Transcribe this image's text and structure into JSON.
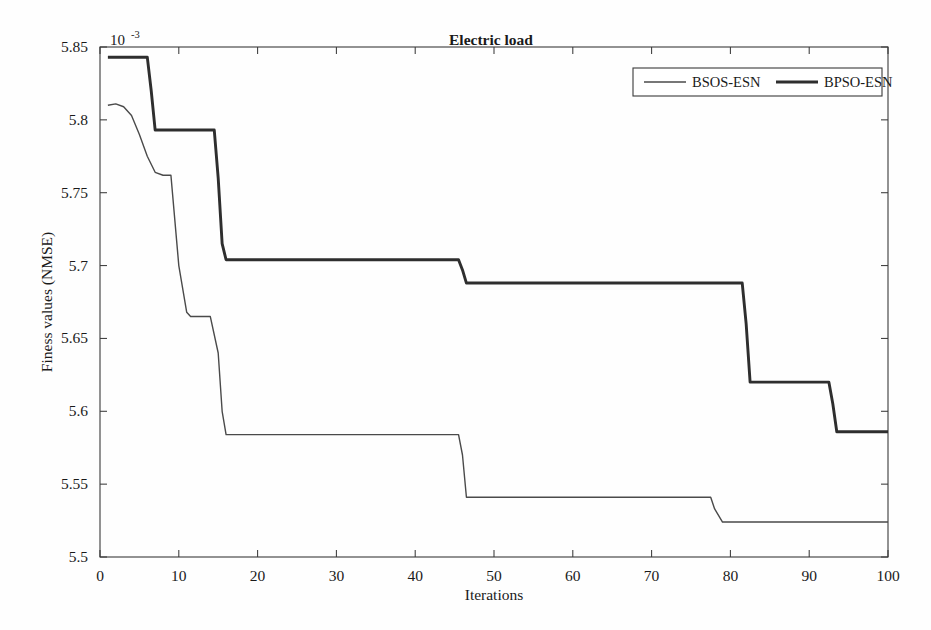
{
  "chart_data": {
    "type": "line",
    "title": "Electric load",
    "subtitle": "",
    "xlabel": "Iterations",
    "ylabel": "Finess values (NMSE)",
    "y_exponent_label": "10",
    "y_exponent_power": "-3",
    "xlim": [
      0,
      100
    ],
    "ylim": [
      5.5,
      5.85
    ],
    "xticks": [
      0,
      10,
      20,
      30,
      40,
      50,
      60,
      70,
      80,
      90,
      100
    ],
    "xticklabels": [
      "0",
      "10",
      "20",
      "30",
      "40",
      "50",
      "60",
      "70",
      "80",
      "90",
      "100"
    ],
    "yticks": [
      5.5,
      5.55,
      5.6,
      5.65,
      5.7,
      5.75,
      5.8,
      5.85
    ],
    "yticklabels": [
      "5.5",
      "5.55",
      "5.6",
      "5.65",
      "5.7",
      "5.75",
      "5.8",
      "5.85"
    ],
    "grid": false,
    "legend_position": "top-right",
    "legend": [
      "BSOS-ESN",
      "BPSO-ESN"
    ],
    "series": [
      {
        "name": "BSOS-ESN",
        "style": "thin",
        "color": "#4a4a4a",
        "x": [
          1,
          2,
          3,
          4,
          5,
          6,
          7,
          8,
          9,
          10,
          11,
          11.5,
          12,
          14,
          15,
          15.5,
          16,
          45.5,
          46,
          46.5,
          77.5,
          78,
          79,
          100
        ],
        "y": [
          5.81,
          5.811,
          5.809,
          5.803,
          5.79,
          5.775,
          5.764,
          5.762,
          5.762,
          5.7,
          5.668,
          5.665,
          5.665,
          5.665,
          5.64,
          5.6,
          5.584,
          5.584,
          5.57,
          5.541,
          5.541,
          5.533,
          5.524,
          5.524
        ]
      },
      {
        "name": "BPSO-ESN",
        "style": "thick",
        "color": "#2e2e2e",
        "x": [
          1,
          2,
          6,
          6.5,
          7,
          14.5,
          15,
          15.5,
          16,
          45.5,
          46,
          46.5,
          81.5,
          82,
          82.5,
          92.5,
          93,
          93.5,
          100
        ],
        "y": [
          5.843,
          5.843,
          5.843,
          5.82,
          5.793,
          5.793,
          5.76,
          5.715,
          5.704,
          5.704,
          5.697,
          5.688,
          5.688,
          5.66,
          5.62,
          5.62,
          5.605,
          5.586,
          5.586
        ]
      }
    ],
    "annotations": []
  },
  "figure": {
    "background_color": "#fefefe",
    "axis_color": "#3a3a3a"
  }
}
